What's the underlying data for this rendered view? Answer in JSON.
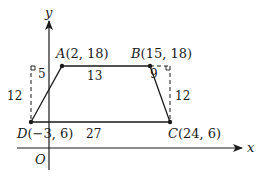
{
  "diagram": {
    "type": "trapezoid-on-coordinate-plane",
    "axes": {
      "x_label": "x",
      "y_label": "y",
      "origin_label": "O"
    },
    "points": [
      {
        "name": "A",
        "label": "A(2, 18)",
        "x": 2,
        "y": 18
      },
      {
        "name": "B",
        "label": "B(15, 18)",
        "x": 15,
        "y": 18
      },
      {
        "name": "C",
        "label": "C(24, 6)",
        "x": 24,
        "y": 6
      },
      {
        "name": "D",
        "label": "D(−3, 6)",
        "x": -3,
        "y": 6
      }
    ],
    "point_labels": {
      "A_letter": "A",
      "A_coords": "(2, 18)",
      "B_letter": "B",
      "B_coords": "(15, 18)",
      "C_letter": "C",
      "C_coords": "(24, 6)",
      "D_letter": "D",
      "D_coords": "(−3, 6)"
    },
    "measurements": {
      "top_left_offset": "5",
      "top_base": "13",
      "top_right_offset": "9",
      "left_height": "12",
      "right_height": "12",
      "bottom_base": "27"
    },
    "colors": {
      "stroke": "#1a1a1a",
      "background": "#ffffff"
    }
  }
}
